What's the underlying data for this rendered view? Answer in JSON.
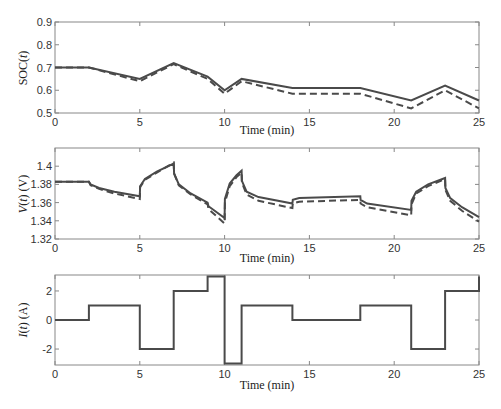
{
  "chart_data": [
    {
      "type": "line",
      "title": "",
      "xlabel": "Time (min)",
      "ylabel": "SOC(t)",
      "xlim": [
        0,
        25
      ],
      "ylim": [
        0.5,
        0.9
      ],
      "xticks": [
        0,
        5,
        10,
        15,
        20,
        25
      ],
      "yticks": [
        0.5,
        0.6,
        0.7,
        0.8,
        0.9
      ],
      "ytick_labels": [
        "0.5",
        "0.6",
        "0.7",
        "0.8",
        "0.9"
      ],
      "grid": false,
      "legend": null,
      "x": [
        0,
        2,
        5,
        7,
        9,
        10,
        11,
        14,
        18,
        21,
        23,
        25
      ],
      "series": [
        {
          "name": "solid",
          "style": "solid",
          "values": [
            0.7,
            0.7,
            0.65,
            0.72,
            0.66,
            0.6,
            0.65,
            0.61,
            0.61,
            0.555,
            0.62,
            0.555
          ]
        },
        {
          "name": "dashed",
          "style": "dashed",
          "values": [
            0.7,
            0.7,
            0.64,
            0.715,
            0.65,
            0.585,
            0.64,
            0.585,
            0.585,
            0.52,
            0.6,
            0.52
          ]
        }
      ]
    },
    {
      "type": "line",
      "title": "",
      "xlabel": "Time (min)",
      "ylabel": "V(t) (V)",
      "xlim": [
        0,
        25
      ],
      "ylim": [
        1.32,
        1.42
      ],
      "xticks": [
        0,
        5,
        10,
        15,
        20,
        25
      ],
      "yticks": [
        1.32,
        1.34,
        1.36,
        1.38,
        1.4
      ],
      "ytick_labels": [
        "1.32",
        "1.34",
        "1.36",
        "1.38",
        "1.4"
      ],
      "grid": false,
      "legend": null,
      "series": [
        {
          "name": "solid",
          "style": "solid",
          "points": [
            [
              0,
              1.383
            ],
            [
              2,
              1.383
            ],
            [
              2.1,
              1.38
            ],
            [
              2.6,
              1.376
            ],
            [
              3.5,
              1.372
            ],
            [
              5,
              1.367
            ],
            [
              5.02,
              1.378
            ],
            [
              5.3,
              1.386
            ],
            [
              6,
              1.394
            ],
            [
              7,
              1.403
            ],
            [
              7.02,
              1.392
            ],
            [
              7.3,
              1.38
            ],
            [
              8,
              1.37
            ],
            [
              9,
              1.36
            ],
            [
              9.05,
              1.356
            ],
            [
              10,
              1.343
            ],
            [
              10.02,
              1.364
            ],
            [
              10.3,
              1.381
            ],
            [
              10.7,
              1.39
            ],
            [
              11,
              1.395
            ],
            [
              11.02,
              1.384
            ],
            [
              11.3,
              1.372
            ],
            [
              12,
              1.366
            ],
            [
              14,
              1.359
            ],
            [
              14.02,
              1.363
            ],
            [
              14.4,
              1.365
            ],
            [
              18,
              1.367
            ],
            [
              18.02,
              1.363
            ],
            [
              18.4,
              1.359
            ],
            [
              21,
              1.352
            ],
            [
              21.02,
              1.362
            ],
            [
              21.3,
              1.372
            ],
            [
              22,
              1.38
            ],
            [
              23,
              1.387
            ],
            [
              23.02,
              1.376
            ],
            [
              23.3,
              1.365
            ],
            [
              24,
              1.355
            ],
            [
              25,
              1.344
            ]
          ]
        },
        {
          "name": "dashed",
          "style": "dashed",
          "points": [
            [
              0,
              1.383
            ],
            [
              2,
              1.383
            ],
            [
              2.1,
              1.379
            ],
            [
              2.6,
              1.375
            ],
            [
              3.5,
              1.37
            ],
            [
              5,
              1.364
            ],
            [
              5.02,
              1.377
            ],
            [
              5.3,
              1.385
            ],
            [
              6,
              1.393
            ],
            [
              7,
              1.404
            ],
            [
              7.02,
              1.392
            ],
            [
              7.3,
              1.379
            ],
            [
              8,
              1.369
            ],
            [
              9,
              1.358
            ],
            [
              9.05,
              1.353
            ],
            [
              10,
              1.337
            ],
            [
              10.02,
              1.36
            ],
            [
              10.3,
              1.378
            ],
            [
              10.7,
              1.388
            ],
            [
              11,
              1.393
            ],
            [
              11.02,
              1.382
            ],
            [
              11.3,
              1.369
            ],
            [
              12,
              1.362
            ],
            [
              14,
              1.354
            ],
            [
              14.02,
              1.359
            ],
            [
              14.4,
              1.361
            ],
            [
              18,
              1.363
            ],
            [
              18.02,
              1.359
            ],
            [
              18.4,
              1.355
            ],
            [
              21,
              1.346
            ],
            [
              21.02,
              1.358
            ],
            [
              21.3,
              1.37
            ],
            [
              22,
              1.378
            ],
            [
              23,
              1.386
            ],
            [
              23.02,
              1.374
            ],
            [
              23.3,
              1.362
            ],
            [
              24,
              1.351
            ],
            [
              25,
              1.339
            ]
          ]
        }
      ]
    },
    {
      "type": "line",
      "title": "",
      "xlabel": "Time (min)",
      "ylabel": "I(t) (A)",
      "xlim": [
        0,
        25
      ],
      "ylim": [
        -3.1,
        3.1
      ],
      "xticks": [
        0,
        5,
        10,
        15,
        20,
        25
      ],
      "yticks": [
        -2,
        0,
        2
      ],
      "ytick_labels": [
        "-2",
        "0",
        "2"
      ],
      "grid": false,
      "legend": null,
      "series": [
        {
          "name": "current",
          "style": "step",
          "points": [
            [
              0,
              0
            ],
            [
              2,
              0
            ],
            [
              2,
              1
            ],
            [
              5,
              1
            ],
            [
              5,
              -2
            ],
            [
              7,
              -2
            ],
            [
              7,
              2
            ],
            [
              9,
              2
            ],
            [
              9,
              3
            ],
            [
              10,
              3
            ],
            [
              10,
              -3
            ],
            [
              11,
              -3
            ],
            [
              11,
              1
            ],
            [
              14,
              1
            ],
            [
              14,
              0
            ],
            [
              18,
              0
            ],
            [
              18,
              1
            ],
            [
              21,
              1
            ],
            [
              21,
              -2
            ],
            [
              23,
              -2
            ],
            [
              23,
              2
            ],
            [
              25,
              2
            ],
            [
              25,
              3
            ]
          ]
        }
      ]
    }
  ],
  "labels": {
    "xlabel": "Time (min)",
    "soc_ylabel_main": "SOC(",
    "soc_ylabel_var": "t",
    "soc_ylabel_end": ")",
    "v_ylabel_main": "V",
    "v_ylabel_mid": "(",
    "v_ylabel_var": "t",
    "v_ylabel_end": ") (V)",
    "i_ylabel_main": "I",
    "i_ylabel_var": "t",
    "i_ylabel_end": ") (A)"
  },
  "colors": {
    "line": "#4a4a4a",
    "axis": "#888888",
    "text": "#333333"
  }
}
